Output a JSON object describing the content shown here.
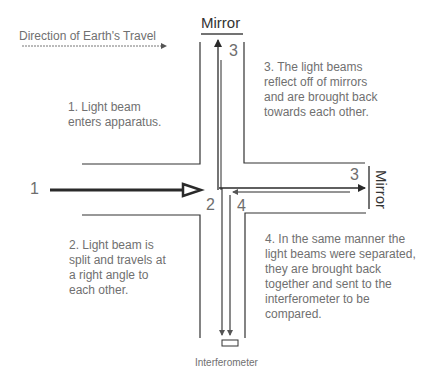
{
  "direction_label": "Direction of Earth's Travel",
  "mirror_top_label": "Mirror",
  "mirror_right_label": "Mirror",
  "interferometer_label": "Interferometer",
  "markers": {
    "input": "1",
    "splitter": "2",
    "top_mirror": "3",
    "right_mirror": "3",
    "return": "4"
  },
  "steps": [
    {
      "id": 1,
      "lines": [
        "1. Light beam",
        "enters apparatus."
      ]
    },
    {
      "id": 2,
      "lines": [
        "2. Light beam is",
        "split and travels at",
        "a right angle to",
        "each other."
      ]
    },
    {
      "id": 3,
      "lines": [
        "3. The light beams",
        "reflect off of mirrors",
        "and are brought back",
        "towards each other."
      ]
    },
    {
      "id": 4,
      "lines": [
        "4. In the same manner the",
        "light beams were separated,",
        "they are brought back",
        "together and sent to the",
        "interferometer to be",
        "compared."
      ]
    }
  ],
  "colors": {
    "line": "#333333",
    "text": "#707070",
    "beam": "#2a2a2a"
  }
}
